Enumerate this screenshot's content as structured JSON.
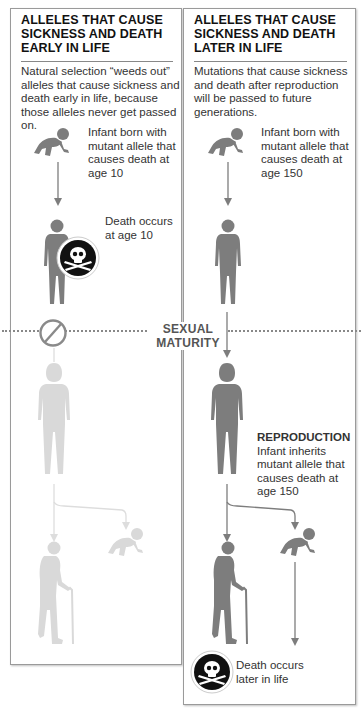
{
  "left_panel": {
    "title_lines": [
      "ALLELES THAT CAUSE",
      "SICKNESS AND DEATH",
      "EARLY IN LIFE"
    ],
    "description": "Natural selection “weeds out” alleles that cause sickness and death early in life, because those alleles never get passed on.",
    "infant_caption": "Infant born with mutant allele that causes death at age 10",
    "death_caption": "Death occurs at age 10",
    "icons": [
      "infant-crawling-icon",
      "child-figure-icon",
      "skull-crossbones-icon",
      "prohibited-icon",
      "adult-woman-faded-icon",
      "elderly-man-cane-faded-icon",
      "infant-faded-icon"
    ]
  },
  "right_panel": {
    "title_lines": [
      "ALLELES THAT CAUSE",
      "SICKNESS AND DEATH",
      "LATER IN LIFE"
    ],
    "description": "Mutations that cause sickness and death after reproduction will be passed to future generations.",
    "infant_caption": "Infant born with mutant allele that causes death at age 150",
    "reproduction_heading": "REPRODUCTION",
    "reproduction_caption": "Infant inherits mutant allele that causes death at age 150",
    "death_caption": "Death occurs later in life",
    "icons": [
      "infant-crawling-icon",
      "child-figure-icon",
      "adult-woman-icon",
      "elderly-man-cane-icon",
      "infant-crawling-icon",
      "skull-crossbones-icon"
    ]
  },
  "divider": {
    "label_line1": "SEXUAL",
    "label_line2": "MATURITY"
  },
  "colors": {
    "figure_dark": "#7d7d7d",
    "figure_faded": "#d9d9d9",
    "skull_badge": "#111111",
    "divider": "#888888"
  }
}
